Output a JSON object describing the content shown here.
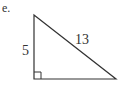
{
  "problem": {
    "label": "e."
  },
  "triangle": {
    "type": "right-triangle",
    "stroke_color": "#333333",
    "vertices": {
      "top": [
        34,
        15
      ],
      "right_angle": [
        34,
        79
      ],
      "bottom_right": [
        116,
        79
      ]
    },
    "sides": {
      "vertical_leg": "5",
      "hypotenuse": "13",
      "horizontal_leg": ""
    },
    "right_angle_marker": "square"
  }
}
